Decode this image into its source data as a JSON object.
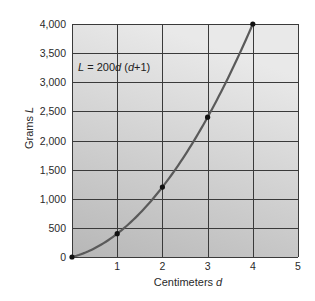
{
  "chart_data": {
    "type": "line",
    "title": "",
    "xlabel": "Centimeters d",
    "ylabel": "Grams L",
    "xlim": [
      0,
      5
    ],
    "ylim": [
      0,
      4000
    ],
    "x_ticks": [
      1,
      2,
      3,
      4,
      5
    ],
    "y_ticks": [
      0,
      500,
      1000,
      1500,
      2000,
      2500,
      3000,
      3500,
      4000
    ],
    "x_tick_labels": [
      "1",
      "2",
      "3",
      "4",
      "5"
    ],
    "y_tick_labels": [
      "0",
      "500",
      "1,000",
      "1,500",
      "2,000",
      "2,500",
      "3,000",
      "3,500",
      "4,000"
    ],
    "grid": true,
    "legend": null,
    "annotation": "L = 200d (d+1)",
    "series": [
      {
        "name": "L = 200d(d+1)",
        "function": "200*d*(d+1)",
        "x": [
          0,
          1,
          2,
          3,
          4
        ],
        "values": [
          0,
          400,
          1200,
          2400,
          4000
        ],
        "markers": true
      }
    ],
    "colors": {
      "curve": "#5a5a5a",
      "marker": "#111111",
      "plot_bg_top": "#e9e9e9",
      "plot_bg_bottom": "#b7b7b7",
      "grid": "#3a3a3a"
    }
  },
  "labels": {
    "xlabel_text": "Centimeters ",
    "xlabel_var": "d",
    "ylabel_text": "Grams ",
    "ylabel_var": "L",
    "formula_lhs": "L",
    "formula_mid": " = 200",
    "formula_d": "d",
    "formula_paren_open": " (",
    "formula_d2": "d",
    "formula_rest": "+1)",
    "origin": "0"
  }
}
